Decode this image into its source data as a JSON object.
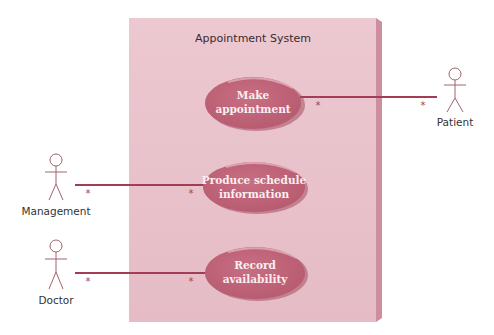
{
  "diagram": {
    "type": "UML use case diagram",
    "system": {
      "title": "Appointment System"
    },
    "use_cases": [
      {
        "id": "make-appointment",
        "lines": [
          "Make",
          "appointment"
        ]
      },
      {
        "id": "produce-schedule-information",
        "lines": [
          "Produce schedule",
          "information"
        ]
      },
      {
        "id": "record-availability",
        "lines": [
          "Record",
          "availability"
        ]
      }
    ],
    "actors": [
      {
        "id": "patient",
        "label": "Patient"
      },
      {
        "id": "management",
        "label": "Management"
      },
      {
        "id": "doctor",
        "label": "Doctor"
      }
    ],
    "associations": [
      {
        "actor": "Patient",
        "use_case": "Make appointment",
        "actor_multiplicity": "*",
        "use_case_multiplicity": "*"
      },
      {
        "actor": "Management",
        "use_case": "Produce schedule information",
        "actor_multiplicity": "*",
        "use_case_multiplicity": "*"
      },
      {
        "actor": "Doctor",
        "use_case": "Record availability",
        "actor_multiplicity": "*",
        "use_case_multiplicity": "*"
      }
    ],
    "colors": {
      "system_fill": "#e8c0ca",
      "system_side": "#cf8e9f",
      "use_case_fill": "#c4687c",
      "association_line": "#a33d55",
      "actor_stroke": "#a06470"
    }
  }
}
